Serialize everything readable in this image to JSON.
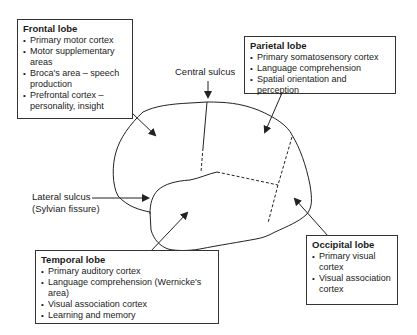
{
  "boxes": {
    "frontal": {
      "title": "Frontal lobe",
      "items": [
        "Primary motor cortex",
        "Motor supplementary areas",
        "Broca's area – speech production",
        "Prefrontal cortex – personality, insight"
      ]
    },
    "parietal": {
      "title": "Parietal lobe",
      "items": [
        "Primary somatosensory cortex",
        "Language comprehension",
        "Spatial orientation and perception"
      ]
    },
    "temporal": {
      "title": "Temporal lobe",
      "items": [
        "Primary auditory cortex",
        "Language comprehension (Wernicke's area)",
        "Visual association cortex",
        "Learning and memory"
      ]
    },
    "occipital": {
      "title": "Occipital lobe",
      "items": [
        "Primary visual cortex",
        "Visual association cortex"
      ]
    }
  },
  "labels": {
    "central_sulcus": "Central sulcus",
    "lateral_sulcus_line1": "Lateral sulcus",
    "lateral_sulcus_line2": "(Sylvian fissure)"
  },
  "colors": {
    "line": "#222222",
    "background": "#ffffff"
  }
}
